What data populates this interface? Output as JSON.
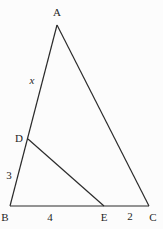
{
  "diagram": {
    "type": "geometry-triangle",
    "line_color": "#2b2b2b",
    "background": "#fcfcfc",
    "vertices": {
      "A": "A",
      "B": "B",
      "C": "C"
    },
    "points": {
      "D": "D",
      "E": "E"
    },
    "segment_labels": {
      "AD": "x",
      "DB": "3",
      "BE": "4",
      "EC": "2"
    }
  }
}
